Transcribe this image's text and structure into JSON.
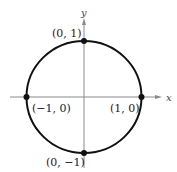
{
  "diagram": {
    "axes": {
      "x_label": "x",
      "y_label": "y",
      "color": "#8a8a8a"
    },
    "circle": {
      "color": "#111111",
      "center": [
        0,
        0
      ],
      "radius": 1
    },
    "points": [
      {
        "label": "(0, 1)",
        "coords": [
          0,
          1
        ]
      },
      {
        "label": "(-1, 0)",
        "display": "(−1, 0)",
        "coords": [
          -1,
          0
        ]
      },
      {
        "label": "(1, 0)",
        "coords": [
          1,
          0
        ]
      },
      {
        "label": "(0, -1)",
        "display": "(0, −1)",
        "coords": [
          0,
          -1
        ]
      }
    ]
  },
  "labels": {
    "top": "(0, 1)",
    "left": "(−1, 0)",
    "right": "(1, 0)",
    "bottom": "(0, −1)",
    "x": "x",
    "y": "y"
  }
}
